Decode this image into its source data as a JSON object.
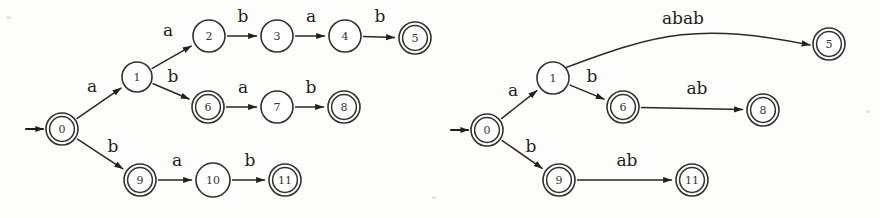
{
  "figure": {
    "background_color": "#fdfdfc",
    "ink_color": "#2a2724",
    "diagram_count": 2
  },
  "diagrams": [
    {
      "name": "expanded-trie-automaton",
      "caption": "",
      "start_state": "0",
      "states": [
        {
          "id": "s0",
          "label": "0",
          "cx": 62,
          "cy": 129,
          "r": 16,
          "accepting": true,
          "start": true
        },
        {
          "id": "s1",
          "label": "1",
          "cx": 137,
          "cy": 77,
          "r": 15,
          "accepting": false,
          "start": false
        },
        {
          "id": "s2",
          "label": "2",
          "cx": 209,
          "cy": 36,
          "r": 16,
          "accepting": false,
          "start": false
        },
        {
          "id": "s3",
          "label": "3",
          "cx": 277,
          "cy": 36,
          "r": 16,
          "accepting": false,
          "start": false
        },
        {
          "id": "s4",
          "label": "4",
          "cx": 345,
          "cy": 36,
          "r": 16,
          "accepting": false,
          "start": false
        },
        {
          "id": "s5",
          "label": "5",
          "cx": 415,
          "cy": 38,
          "r": 16,
          "accepting": true,
          "start": false
        },
        {
          "id": "s6",
          "label": "6",
          "cx": 208,
          "cy": 107,
          "r": 16,
          "accepting": true,
          "start": false
        },
        {
          "id": "s7",
          "label": "7",
          "cx": 277,
          "cy": 107,
          "r": 16,
          "accepting": false,
          "start": false
        },
        {
          "id": "s8",
          "label": "8",
          "cx": 344,
          "cy": 107,
          "r": 16,
          "accepting": true,
          "start": false
        },
        {
          "id": "s9",
          "label": "9",
          "cx": 140,
          "cy": 180,
          "r": 16,
          "accepting": true,
          "start": false
        },
        {
          "id": "s10",
          "label": "10",
          "cx": 213,
          "cy": 180,
          "r": 17,
          "accepting": false,
          "start": false
        },
        {
          "id": "s11",
          "label": "11",
          "cx": 285,
          "cy": 180,
          "r": 16,
          "accepting": true,
          "start": false
        }
      ],
      "transitions": [
        {
          "from": "0",
          "to": "1",
          "symbol": "a",
          "label_x": 92,
          "label_y": 92
        },
        {
          "from": "1",
          "to": "2",
          "symbol": "a",
          "label_x": 168,
          "label_y": 36
        },
        {
          "from": "2",
          "to": "3",
          "symbol": "b",
          "label_x": 243,
          "label_y": 22
        },
        {
          "from": "3",
          "to": "4",
          "symbol": "a",
          "label_x": 311,
          "label_y": 22
        },
        {
          "from": "4",
          "to": "5",
          "symbol": "b",
          "label_x": 380,
          "label_y": 22
        },
        {
          "from": "1",
          "to": "6",
          "symbol": "b",
          "label_x": 173,
          "label_y": 82
        },
        {
          "from": "6",
          "to": "7",
          "symbol": "a",
          "label_x": 243,
          "label_y": 93
        },
        {
          "from": "7",
          "to": "8",
          "symbol": "b",
          "label_x": 311,
          "label_y": 93
        },
        {
          "from": "0",
          "to": "9",
          "symbol": "b",
          "label_x": 113,
          "label_y": 152
        },
        {
          "from": "9",
          "to": "10",
          "symbol": "a",
          "label_x": 177,
          "label_y": 166
        },
        {
          "from": "10",
          "to": "11",
          "symbol": "b",
          "label_x": 250,
          "label_y": 166
        }
      ]
    },
    {
      "name": "compressed-automaton",
      "caption": "",
      "start_state": "0",
      "states": [
        {
          "id": "r0",
          "label": "0",
          "cx": 487,
          "cy": 130,
          "r": 16,
          "accepting": true,
          "start": true
        },
        {
          "id": "r1",
          "label": "1",
          "cx": 553,
          "cy": 78,
          "r": 16,
          "accepting": false,
          "start": false
        },
        {
          "id": "r5",
          "label": "5",
          "cx": 829,
          "cy": 44,
          "r": 16,
          "accepting": true,
          "start": false
        },
        {
          "id": "r6",
          "label": "6",
          "cx": 623,
          "cy": 107,
          "r": 16,
          "accepting": true,
          "start": false
        },
        {
          "id": "r8",
          "label": "8",
          "cx": 763,
          "cy": 110,
          "r": 16,
          "accepting": true,
          "start": false
        },
        {
          "id": "r9",
          "label": "9",
          "cx": 559,
          "cy": 180,
          "r": 16,
          "accepting": true,
          "start": false
        },
        {
          "id": "r11",
          "label": "11",
          "cx": 692,
          "cy": 180,
          "r": 16,
          "accepting": true,
          "start": false
        }
      ],
      "transitions": [
        {
          "from": "0",
          "to": "1",
          "symbol": "a",
          "label_x": 513,
          "label_y": 96
        },
        {
          "from": "1",
          "to": "5",
          "symbol": "abab",
          "label_x": 683,
          "label_y": 24
        },
        {
          "from": "1",
          "to": "6",
          "symbol": "b",
          "label_x": 592,
          "label_y": 82
        },
        {
          "from": "6",
          "to": "8",
          "symbol": "ab",
          "label_x": 697,
          "label_y": 94
        },
        {
          "from": "0",
          "to": "9",
          "symbol": "b",
          "label_x": 531,
          "label_y": 152
        },
        {
          "from": "9",
          "to": "11",
          "symbol": "ab",
          "label_x": 627,
          "label_y": 166
        }
      ]
    }
  ]
}
